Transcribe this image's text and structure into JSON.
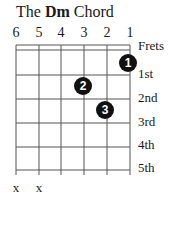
{
  "title": {
    "prefix": "The",
    "chord": "Dm",
    "suffix": "Chord"
  },
  "strings": [
    "6",
    "5",
    "4",
    "3",
    "2",
    "1"
  ],
  "fret_labels": [
    "Frets",
    "1st",
    "2nd",
    "3rd",
    "4th",
    "5th"
  ],
  "fingers": [
    {
      "string": 1,
      "fret": 1,
      "finger": "1"
    },
    {
      "string": 3,
      "fret": 2,
      "finger": "2"
    },
    {
      "string": 2,
      "fret": 3,
      "finger": "3"
    }
  ],
  "muted": [
    {
      "string": 6,
      "label": "x"
    },
    {
      "string": 5,
      "label": "x"
    }
  ],
  "colors": {
    "line": "#555555",
    "dot": "#111111",
    "text": "#1a1a1a"
  }
}
